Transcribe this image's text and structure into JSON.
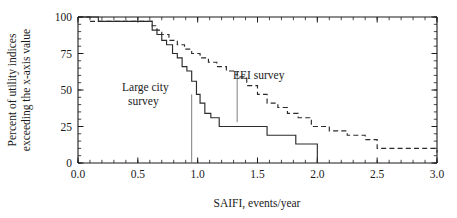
{
  "chart_data": {
    "type": "line",
    "title": "",
    "xlabel": "SAIFI, events/year",
    "ylabel_line1": "Percent of utility indices",
    "ylabel_line2": "exceeding the x-axis value",
    "xlim": [
      0.0,
      3.0
    ],
    "ylim": [
      0,
      100
    ],
    "grid": false,
    "legend_position": "inline-annotations",
    "x_ticks": [
      "0.0",
      "0.5",
      "1.0",
      "1.5",
      "2.0",
      "2.5",
      "3.0"
    ],
    "x_tick_values": [
      0.0,
      0.5,
      1.0,
      1.5,
      2.0,
      2.5,
      3.0
    ],
    "x_minor_step": 0.1,
    "y_ticks": [
      "0",
      "25",
      "50",
      "75",
      "100"
    ],
    "y_tick_values": [
      0,
      25,
      50,
      75,
      100
    ],
    "y_minor_step": 5,
    "series": [
      {
        "name": "Large city survey",
        "style": "solid",
        "annotation_label": "Large city\nsurvey",
        "annotation_line1": "Large city",
        "annotation_line2": "survey",
        "leader_x": 0.95,
        "leader_y_top": 47,
        "leader_y_bottom": 0,
        "step": "post",
        "x": [
          0.0,
          0.17,
          0.55,
          0.62,
          0.66,
          0.7,
          0.74,
          0.79,
          0.83,
          0.87,
          0.91,
          0.95,
          0.99,
          1.02,
          1.06,
          1.11,
          1.18,
          1.33,
          1.58,
          1.82,
          2.0
        ],
        "y": [
          100,
          97,
          97,
          91,
          88,
          84,
          81,
          75,
          72,
          66,
          63,
          56,
          47,
          41,
          34,
          31,
          25,
          25,
          19,
          13,
          0
        ]
      },
      {
        "name": "EEI survey",
        "style": "dashed",
        "annotation_label": "EEI survey",
        "leader_x": 1.33,
        "leader_y_top": 60,
        "leader_y_bottom": 28,
        "step": "post",
        "x": [
          0.0,
          0.1,
          0.55,
          0.62,
          0.66,
          0.7,
          0.76,
          0.83,
          0.89,
          0.95,
          1.02,
          1.09,
          1.16,
          1.24,
          1.33,
          1.41,
          1.5,
          1.58,
          1.67,
          1.75,
          1.84,
          1.95,
          2.1,
          2.25,
          2.4,
          2.5,
          3.0
        ],
        "y": [
          100,
          97,
          97,
          94,
          91,
          88,
          84,
          81,
          78,
          75,
          72,
          69,
          66,
          63,
          59,
          53,
          47,
          41,
          38,
          34,
          31,
          25,
          22,
          19,
          16,
          10,
          7
        ]
      }
    ]
  },
  "colors": {
    "axis": "#1a1a1a",
    "series": "#2b2b2b",
    "leader": "#6f6f6f",
    "background": "#ffffff"
  }
}
